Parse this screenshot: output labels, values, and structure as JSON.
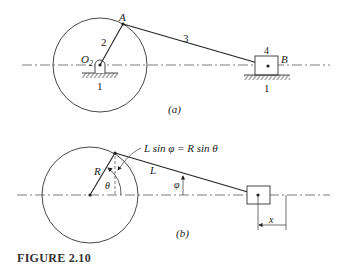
{
  "figure": {
    "caption": "FIGURE 2.10",
    "part_a": {
      "label": "(a)",
      "pivot_label": "O",
      "pivot_subscript": "2",
      "crank_point": "A",
      "slider_point": "B",
      "link_numbers": {
        "ground_left": "1",
        "crank": "2",
        "coupler": "3",
        "slider": "4",
        "ground_right": "1"
      }
    },
    "part_b": {
      "label": "(b)",
      "equation": "L sin φ = R sin θ",
      "crank_label": "R",
      "coupler_label": "L",
      "crank_angle": "θ",
      "coupler_angle": "φ",
      "displacement": "x"
    }
  }
}
